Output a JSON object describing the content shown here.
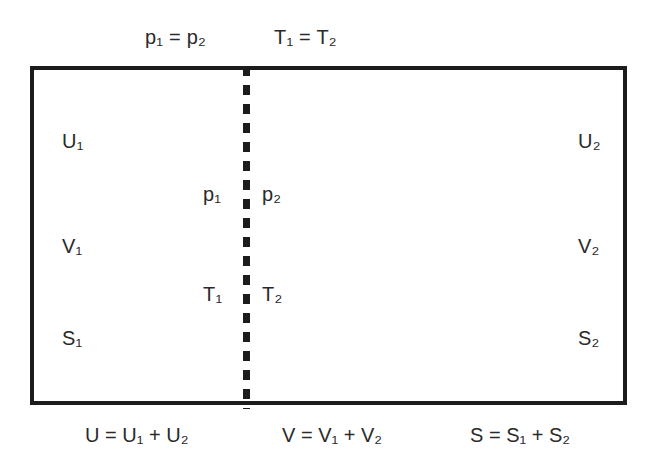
{
  "diagram": {
    "conditions": {
      "pressure_equality": "p₁ = p₂",
      "temperature_equality": "T₁ = T₂"
    },
    "subsystem_1": {
      "internal_energy": "U₁",
      "volume": "V₁",
      "entropy": "S₁",
      "pressure": "p₁",
      "temperature": "T₁"
    },
    "subsystem_2": {
      "internal_energy": "U₂",
      "volume": "V₂",
      "entropy": "S₂",
      "pressure": "p₂",
      "temperature": "T₂"
    },
    "additive_relations": {
      "energy": "U = U₁ + U₂",
      "volume": "V = V₁ + V₂",
      "entropy": "S = S₁ + S₂"
    },
    "colors": {
      "stroke": "#1c1c1c",
      "text": "#2a2a2a",
      "background": "#ffffff"
    }
  }
}
